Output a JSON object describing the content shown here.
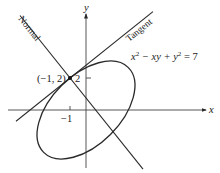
{
  "diagram": {
    "equation": "x² − xy + y² = 7",
    "equation_parts": {
      "x": "x",
      "sq1": "2",
      "mid": " − xy + ",
      "y": "y",
      "sq2": "2",
      "rhs": " = 7"
    },
    "point_label": "(−1, 2)",
    "tick_x": "−1",
    "tick_y": "2",
    "axis_x": "x",
    "axis_y": "y",
    "tangent_label": "Tangent",
    "normal_label": "Normal",
    "line_color": "#2a2a2a"
  }
}
